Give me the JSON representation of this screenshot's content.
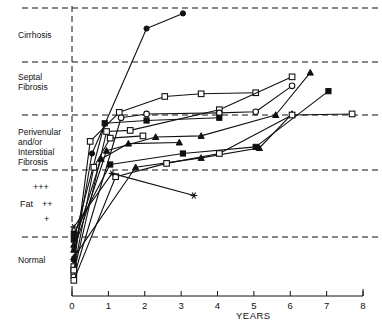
{
  "chart_data": {
    "type": "line",
    "title": "",
    "xlabel": "YEARS",
    "ylabel": "",
    "xlim": [
      0,
      8
    ],
    "ylim": [
      0,
      5
    ],
    "grid": true,
    "legend_position": "none",
    "x_ticks": [
      "0",
      "1",
      "2",
      "3",
      "4",
      "5",
      "6",
      "7",
      "8"
    ],
    "x_tick_values": [
      0,
      1,
      2,
      3,
      4,
      5,
      6,
      7,
      8
    ],
    "y_band_labels": [
      "Cirrhosis",
      "Septal\nFibrosis",
      "Perivenular\nand/or\nInterstitial\nFibrosis",
      "Fat",
      "Normal"
    ],
    "fat_grades": [
      "+++",
      "++",
      "+"
    ],
    "fat_label": "Fat",
    "y_gridline_values": [
      5.0,
      4.0,
      3.0,
      2.0,
      1.0
    ],
    "series": [
      {
        "name": "patient-1",
        "marker": "filled-circle",
        "points": [
          [
            0.05,
            0.55
          ],
          [
            0.55,
            2.3
          ],
          [
            2.05,
            4.62
          ],
          [
            3.05,
            4.9
          ]
        ]
      },
      {
        "name": "patient-2",
        "marker": "open-square",
        "points": [
          [
            0.05,
            0.42
          ],
          [
            0.5,
            2.52
          ],
          [
            1.3,
            3.05
          ],
          [
            2.55,
            3.35
          ],
          [
            3.55,
            3.4
          ],
          [
            5.05,
            3.42
          ]
        ]
      },
      {
        "name": "patient-3",
        "marker": "open-square",
        "points": [
          [
            0.05,
            0.3
          ],
          [
            0.95,
            2.7
          ],
          [
            1.6,
            2.72
          ],
          [
            4.05,
            3.1
          ],
          [
            6.05,
            3.72
          ]
        ]
      },
      {
        "name": "patient-4",
        "marker": "open-circle",
        "points": [
          [
            0.05,
            0.22
          ],
          [
            1.35,
            2.95
          ],
          [
            2.05,
            3.02
          ],
          [
            4.05,
            3.04
          ],
          [
            5.05,
            3.06
          ],
          [
            6.05,
            3.55
          ]
        ]
      },
      {
        "name": "patient-5",
        "marker": "filled-triangle",
        "points": [
          [
            0.05,
            0.75
          ],
          [
            0.95,
            2.35
          ],
          [
            2.3,
            2.6
          ],
          [
            3.55,
            2.62
          ],
          [
            5.6,
            3.0
          ],
          [
            6.55,
            3.8
          ]
        ]
      },
      {
        "name": "patient-6",
        "marker": "filled-square",
        "points": [
          [
            0.05,
            0.95
          ],
          [
            0.9,
            2.85
          ],
          [
            2.05,
            2.9
          ],
          [
            4.05,
            2.95
          ]
        ]
      },
      {
        "name": "patient-7",
        "marker": "filled-square",
        "points": [
          [
            0.05,
            1.05
          ],
          [
            1.05,
            2.1
          ],
          [
            3.05,
            2.3
          ],
          [
            5.05,
            2.42
          ],
          [
            7.05,
            3.45
          ]
        ]
      },
      {
        "name": "patient-8",
        "marker": "filled-triangle",
        "points": [
          [
            0.05,
            0.6
          ],
          [
            1.75,
            2.05
          ],
          [
            3.55,
            2.22
          ],
          [
            5.15,
            2.4
          ],
          [
            6.05,
            3.02
          ]
        ]
      },
      {
        "name": "patient-9",
        "marker": "open-square",
        "points": [
          [
            0.05,
            0.15
          ],
          [
            1.2,
            1.9
          ],
          [
            2.6,
            2.12
          ],
          [
            4.05,
            2.3
          ],
          [
            6.05,
            3.0
          ],
          [
            7.7,
            3.02
          ]
        ]
      },
      {
        "name": "patient-10",
        "marker": "star",
        "points": [
          [
            0.05,
            1.15
          ],
          [
            1.1,
            1.95
          ],
          [
            3.35,
            1.62
          ]
        ]
      },
      {
        "name": "patient-11",
        "marker": "filled-triangle",
        "points": [
          [
            0.05,
            0.85
          ],
          [
            0.8,
            2.2
          ],
          [
            1.55,
            2.48
          ],
          [
            2.95,
            2.5
          ]
        ]
      },
      {
        "name": "patient-12",
        "marker": "open-square",
        "points": [
          [
            0.05,
            0.35
          ],
          [
            0.6,
            2.05
          ],
          [
            1.05,
            2.58
          ],
          [
            1.95,
            2.62
          ]
        ]
      }
    ]
  },
  "axis": {
    "x_title": "YEARS"
  }
}
